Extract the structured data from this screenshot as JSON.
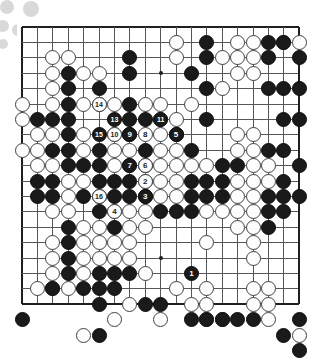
{
  "app": {
    "title": "Go Game Record Diagram",
    "board_size": 19,
    "colors": {
      "black_stone": "#1a1a1a",
      "white_stone": "#fdfdfd",
      "grid_line": "#54565a",
      "border_line": "#1d1f21",
      "background": "#ffffff",
      "decoration": "#d9d9d9"
    }
  },
  "board": {
    "size": 19,
    "star_points": [
      [
        3,
        3
      ],
      [
        3,
        9
      ],
      [
        3,
        15
      ],
      [
        9,
        3
      ],
      [
        9,
        9
      ],
      [
        9,
        15
      ],
      [
        15,
        3
      ],
      [
        15,
        9
      ],
      [
        15,
        15
      ]
    ],
    "black_stones": [
      [
        12,
        1
      ],
      [
        16,
        1
      ],
      [
        17,
        1
      ],
      [
        12,
        2
      ],
      [
        16,
        2
      ],
      [
        18,
        2
      ],
      [
        7,
        2
      ],
      [
        3,
        3
      ],
      [
        7,
        3
      ],
      [
        5,
        4
      ],
      [
        12,
        4
      ],
      [
        16,
        4
      ],
      [
        17,
        4
      ],
      [
        18,
        4
      ],
      [
        3,
        4
      ],
      [
        11,
        3
      ],
      [
        3,
        5
      ],
      [
        7,
        5
      ],
      [
        1,
        6
      ],
      [
        2,
        6
      ],
      [
        3,
        6
      ],
      [
        7,
        6
      ],
      [
        8,
        6
      ],
      [
        12,
        6
      ],
      [
        17,
        6
      ],
      [
        18,
        6
      ],
      [
        3,
        7
      ],
      [
        7,
        7
      ],
      [
        10,
        7
      ],
      [
        2,
        8
      ],
      [
        3,
        8
      ],
      [
        5,
        8
      ],
      [
        8,
        8
      ],
      [
        11,
        8
      ],
      [
        16,
        8
      ],
      [
        17,
        8
      ],
      [
        3,
        9
      ],
      [
        4,
        9
      ],
      [
        5,
        9
      ],
      [
        8,
        9
      ],
      [
        13,
        9
      ],
      [
        14,
        9
      ],
      [
        18,
        9
      ],
      [
        1,
        10
      ],
      [
        2,
        10
      ],
      [
        5,
        10
      ],
      [
        6,
        10
      ],
      [
        7,
        10
      ],
      [
        11,
        10
      ],
      [
        12,
        10
      ],
      [
        13,
        10
      ],
      [
        17,
        10
      ],
      [
        1,
        11
      ],
      [
        2,
        11
      ],
      [
        4,
        11
      ],
      [
        5,
        11
      ],
      [
        6,
        11
      ],
      [
        7,
        11
      ],
      [
        8,
        11
      ],
      [
        11,
        11
      ],
      [
        12,
        11
      ],
      [
        13,
        11
      ],
      [
        16,
        11
      ],
      [
        17,
        11
      ],
      [
        18,
        11
      ],
      [
        5,
        12
      ],
      [
        9,
        12
      ],
      [
        10,
        12
      ],
      [
        11,
        12
      ],
      [
        16,
        12
      ],
      [
        17,
        12
      ],
      [
        3,
        13
      ],
      [
        6,
        13
      ],
      [
        16,
        13
      ],
      [
        3,
        14
      ],
      [
        3,
        15
      ],
      [
        3,
        16
      ],
      [
        5,
        16
      ],
      [
        6,
        16
      ],
      [
        7,
        16
      ],
      [
        2,
        17
      ],
      [
        4,
        17
      ],
      [
        5,
        17
      ],
      [
        6,
        17
      ],
      [
        5,
        18
      ],
      [
        8,
        18
      ],
      [
        9,
        18
      ],
      [
        0,
        19
      ],
      [
        11,
        19
      ],
      [
        12,
        19
      ],
      [
        13,
        19
      ],
      [
        14,
        19
      ],
      [
        15,
        19
      ],
      [
        18,
        19
      ],
      [
        5,
        20
      ],
      [
        17,
        20
      ],
      [
        18,
        21
      ]
    ],
    "white_stones": [
      [
        10,
        1
      ],
      [
        14,
        1
      ],
      [
        15,
        1
      ],
      [
        17,
        1
      ],
      [
        18,
        1
      ],
      [
        2,
        2
      ],
      [
        3,
        2
      ],
      [
        10,
        2
      ],
      [
        13,
        2
      ],
      [
        14,
        2
      ],
      [
        15,
        2
      ],
      [
        2,
        3
      ],
      [
        4,
        3
      ],
      [
        5,
        3
      ],
      [
        14,
        3
      ],
      [
        15,
        3
      ],
      [
        2,
        4
      ],
      [
        13,
        4
      ],
      [
        0,
        5
      ],
      [
        2,
        5
      ],
      [
        4,
        5
      ],
      [
        5,
        5
      ],
      [
        6,
        5
      ],
      [
        8,
        5
      ],
      [
        9,
        5
      ],
      [
        11,
        5
      ],
      [
        0,
        6
      ],
      [
        9,
        6
      ],
      [
        10,
        6
      ],
      [
        1,
        7
      ],
      [
        2,
        7
      ],
      [
        4,
        7
      ],
      [
        6,
        7
      ],
      [
        9,
        7
      ],
      [
        14,
        7
      ],
      [
        15,
        7
      ],
      [
        0,
        8
      ],
      [
        1,
        8
      ],
      [
        4,
        8
      ],
      [
        6,
        8
      ],
      [
        7,
        8
      ],
      [
        9,
        8
      ],
      [
        10,
        8
      ],
      [
        14,
        8
      ],
      [
        15,
        8
      ],
      [
        1,
        9
      ],
      [
        2,
        9
      ],
      [
        6,
        9
      ],
      [
        7,
        9
      ],
      [
        9,
        9
      ],
      [
        10,
        9
      ],
      [
        11,
        9
      ],
      [
        12,
        9
      ],
      [
        15,
        9
      ],
      [
        16,
        9
      ],
      [
        3,
        10
      ],
      [
        4,
        10
      ],
      [
        8,
        10
      ],
      [
        9,
        10
      ],
      [
        10,
        10
      ],
      [
        14,
        10
      ],
      [
        15,
        10
      ],
      [
        16,
        10
      ],
      [
        3,
        11
      ],
      [
        9,
        11
      ],
      [
        10,
        11
      ],
      [
        14,
        11
      ],
      [
        15,
        11
      ],
      [
        2,
        12
      ],
      [
        3,
        12
      ],
      [
        6,
        12
      ],
      [
        7,
        12
      ],
      [
        8,
        12
      ],
      [
        12,
        12
      ],
      [
        13,
        12
      ],
      [
        14,
        12
      ],
      [
        15,
        12
      ],
      [
        4,
        13
      ],
      [
        5,
        13
      ],
      [
        7,
        13
      ],
      [
        8,
        13
      ],
      [
        14,
        13
      ],
      [
        15,
        13
      ],
      [
        2,
        14
      ],
      [
        4,
        14
      ],
      [
        5,
        14
      ],
      [
        6,
        14
      ],
      [
        7,
        14
      ],
      [
        12,
        14
      ],
      [
        15,
        14
      ],
      [
        2,
        15
      ],
      [
        4,
        15
      ],
      [
        5,
        15
      ],
      [
        6,
        15
      ],
      [
        7,
        15
      ],
      [
        15,
        15
      ],
      [
        2,
        16
      ],
      [
        4,
        16
      ],
      [
        8,
        16
      ],
      [
        1,
        17
      ],
      [
        2,
        17
      ],
      [
        3,
        17
      ],
      [
        10,
        17
      ],
      [
        12,
        17
      ],
      [
        15,
        17
      ],
      [
        16,
        17
      ],
      [
        7,
        18
      ],
      [
        11,
        18
      ],
      [
        12,
        18
      ],
      [
        15,
        18
      ],
      [
        16,
        18
      ],
      [
        6,
        19
      ],
      [
        9,
        19
      ],
      [
        12,
        19
      ],
      [
        13,
        19
      ],
      [
        16,
        19
      ],
      [
        4,
        20
      ],
      [
        18,
        20
      ]
    ],
    "numbered_moves": [
      {
        "n": "1",
        "color": "black",
        "x": 11,
        "y": 16
      },
      {
        "n": "2",
        "color": "white",
        "x": 8,
        "y": 10
      },
      {
        "n": "3",
        "color": "black",
        "x": 8,
        "y": 11
      },
      {
        "n": "4",
        "color": "white",
        "x": 6,
        "y": 12
      },
      {
        "n": "5",
        "color": "black",
        "x": 10,
        "y": 7
      },
      {
        "n": "6",
        "color": "white",
        "x": 8,
        "y": 9
      },
      {
        "n": "7",
        "color": "black",
        "x": 7,
        "y": 9
      },
      {
        "n": "8",
        "color": "white",
        "x": 8,
        "y": 7
      },
      {
        "n": "9",
        "color": "black",
        "x": 7,
        "y": 7
      },
      {
        "n": "10",
        "color": "white",
        "x": 6,
        "y": 7
      },
      {
        "n": "11",
        "color": "black",
        "x": 9,
        "y": 6
      },
      {
        "n": "13",
        "color": "black",
        "x": 6,
        "y": 6
      },
      {
        "n": "14",
        "color": "white",
        "x": 5,
        "y": 5
      },
      {
        "n": "15",
        "color": "black",
        "x": 5,
        "y": 7
      },
      {
        "n": "16",
        "color": "white",
        "x": 5,
        "y": 11
      }
    ]
  },
  "decorations": [
    {
      "cx": 7,
      "cy": 7,
      "r": 7
    },
    {
      "cx": 31,
      "cy": 9,
      "r": 8
    },
    {
      "cx": 3,
      "cy": 26,
      "r": 6
    },
    {
      "cx": 18,
      "cy": 30,
      "r": 6
    },
    {
      "cx": 3,
      "cy": 44,
      "r": 5
    }
  ]
}
